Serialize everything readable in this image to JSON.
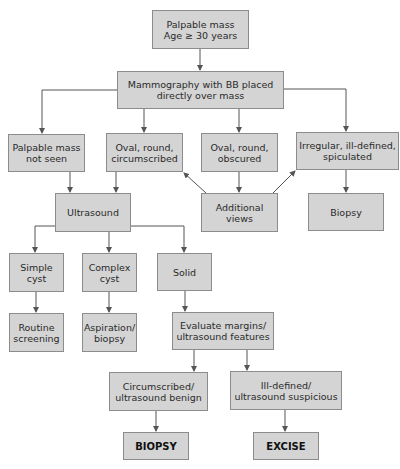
{
  "diagram": {
    "type": "flowchart",
    "colors": {
      "node_fill": "#d4d4d4",
      "node_border": "#8c8c8c",
      "edge": "#555555",
      "background": "#ffffff"
    },
    "nodes": {
      "start": "Palpable mass\nAge ≥ 30 years",
      "mammography": "Mammography with BB placed\ndirectly over mass",
      "not_seen": "Palpable mass\nnot seen",
      "oval_circumscribed": "Oval, round,\ncircumscribed",
      "oval_obscured": "Oval, round,\nobscured",
      "irregular": "Irregular, ill-defined,\nspiculated",
      "ultrasound": "Ultrasound",
      "additional_views": "Additional\nviews",
      "biopsy_top": "Biopsy",
      "simple_cyst": "Simple\ncyst",
      "complex_cyst": "Complex\ncyst",
      "solid": "Solid",
      "routine_screening": "Routine\nscreening",
      "aspiration_biopsy": "Aspiration/\nbiopsy",
      "evaluate_margins": "Evaluate margins/\nultrasound features",
      "circumscribed_benign": "Circumscribed/\nultrasound benign",
      "ill_defined_suspicious": "Ill-defined/\nultrasound suspicious",
      "biopsy_final": "BIOPSY",
      "excise_final": "EXCISE"
    },
    "edges": [
      [
        "start",
        "mammography"
      ],
      [
        "mammography",
        "not_seen"
      ],
      [
        "mammography",
        "oval_circumscribed"
      ],
      [
        "mammography",
        "oval_obscured"
      ],
      [
        "mammography",
        "irregular"
      ],
      [
        "not_seen",
        "ultrasound"
      ],
      [
        "oval_circumscribed",
        "ultrasound"
      ],
      [
        "oval_obscured",
        "additional_views"
      ],
      [
        "additional_views",
        "oval_circumscribed"
      ],
      [
        "additional_views",
        "irregular"
      ],
      [
        "irregular",
        "biopsy_top"
      ],
      [
        "ultrasound",
        "simple_cyst"
      ],
      [
        "ultrasound",
        "complex_cyst"
      ],
      [
        "ultrasound",
        "solid"
      ],
      [
        "simple_cyst",
        "routine_screening"
      ],
      [
        "complex_cyst",
        "aspiration_biopsy"
      ],
      [
        "solid",
        "evaluate_margins"
      ],
      [
        "evaluate_margins",
        "circumscribed_benign"
      ],
      [
        "evaluate_margins",
        "ill_defined_suspicious"
      ],
      [
        "circumscribed_benign",
        "biopsy_final"
      ],
      [
        "ill_defined_suspicious",
        "excise_final"
      ]
    ]
  }
}
